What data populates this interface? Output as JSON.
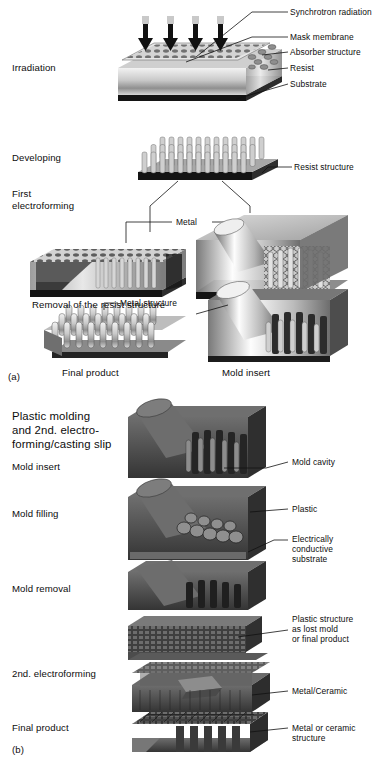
{
  "figure": {
    "title_semantics": "LIGA process flow diagram",
    "panels": [
      {
        "id": "a",
        "marker": "(a)",
        "stage_labels": [
          {
            "key": "irradiation",
            "text": "Irradiation"
          },
          {
            "key": "developing",
            "text": "Developing"
          },
          {
            "key": "first_electroforming_l1",
            "text": "First"
          },
          {
            "key": "first_electroforming_l2",
            "text": "electroforming"
          },
          {
            "key": "removal",
            "text": "Removal of the resist structure"
          }
        ],
        "callouts": [
          {
            "key": "synchrotron_radiation",
            "text": "Synchrotron radiation"
          },
          {
            "key": "mask_membrane",
            "text": "Mask membrane"
          },
          {
            "key": "absorber_structure",
            "text": "Absorber structure"
          },
          {
            "key": "resist",
            "text": "Resist"
          },
          {
            "key": "substrate",
            "text": "Substrate"
          },
          {
            "key": "resist_structure",
            "text": "Resist structure"
          },
          {
            "key": "metal",
            "text": "Metal"
          },
          {
            "key": "metal_structure",
            "text": "Metal structure"
          }
        ],
        "captions": [
          {
            "key": "final_product",
            "text": "Final product"
          },
          {
            "key": "mold_insert",
            "text": "Mold insert"
          }
        ]
      },
      {
        "id": "b",
        "marker": "(b)",
        "heading": [
          "Plastic molding",
          "and 2nd. electro-",
          "forming/casting slip"
        ],
        "stage_labels": [
          {
            "key": "mold_insert",
            "text": "Mold insert"
          },
          {
            "key": "mold_filling",
            "text": "Mold filling"
          },
          {
            "key": "mold_removal",
            "text": "Mold removal"
          },
          {
            "key": "second_electroforming",
            "text": "2nd. electroforming"
          },
          {
            "key": "final_product",
            "text": "Final product"
          }
        ],
        "callouts": [
          {
            "key": "mold_cavity",
            "text": "Mold cavity"
          },
          {
            "key": "plastic",
            "text": "Plastic"
          },
          {
            "key": "electrically_conductive_substrate",
            "lines": [
              "Electrically",
              "conductive",
              "substrate"
            ]
          },
          {
            "key": "plastic_structure",
            "lines": [
              "Plastic structure",
              "as lost mold",
              "or final product"
            ]
          },
          {
            "key": "metal_ceramic",
            "text": "Metal/Ceramic"
          },
          {
            "key": "metal_or_ceramic_structure",
            "lines": [
              "Metal or ceramic",
              "structure"
            ]
          }
        ]
      }
    ],
    "colors": {
      "ink": "#111111",
      "paper": "#ffffff",
      "metal_light": "#e4e4e4",
      "metal_mid": "#9a9a9a",
      "metal_dark": "#4a4a4a",
      "plastic_dark": "#3d3d3d"
    }
  }
}
